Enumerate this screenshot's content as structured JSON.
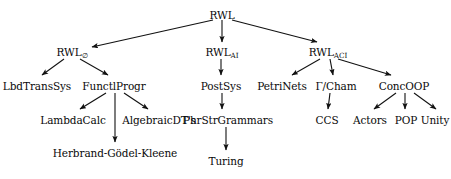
{
  "diagram": {
    "type": "tree",
    "background_color": "#ffffff",
    "text_color": "#0a0a0a",
    "edge_color": "#111111",
    "nodes": [
      {
        "id": "rwl",
        "label": "RWL",
        "sub": "",
        "x": 222,
        "y": 9,
        "level": 0
      },
      {
        "id": "rwl_empty",
        "label": "RWL",
        "sub": "∅",
        "x": 72,
        "y": 46,
        "level": 1
      },
      {
        "id": "rwl_ai",
        "label": "RWL",
        "sub": "AI",
        "x": 222,
        "y": 46,
        "level": 1
      },
      {
        "id": "rwl_aci",
        "label": "RWL",
        "sub": "ACI",
        "x": 328,
        "y": 46,
        "level": 1
      },
      {
        "id": "lbdtranssys",
        "label": "LbdTransSys",
        "sub": "",
        "x": 37,
        "y": 80,
        "level": 2
      },
      {
        "id": "functlprogr",
        "label": "FunctlProgr",
        "sub": "",
        "x": 114,
        "y": 80,
        "level": 2
      },
      {
        "id": "postsys",
        "label": "PostSys",
        "sub": "",
        "x": 221,
        "y": 80,
        "level": 2
      },
      {
        "id": "petrinets",
        "label": "PetriNets",
        "sub": "",
        "x": 282,
        "y": 80,
        "level": 2
      },
      {
        "id": "gammacham",
        "label": "Γ/Cham",
        "sub": "",
        "x": 336,
        "y": 80,
        "level": 2
      },
      {
        "id": "concoop",
        "label": "ConcOOP",
        "sub": "",
        "x": 404,
        "y": 80,
        "level": 2
      },
      {
        "id": "lambdacalc",
        "label": "LambdaCalc",
        "sub": "",
        "x": 73,
        "y": 114,
        "level": 3
      },
      {
        "id": "algebraicdts",
        "label": "AlgebraicDT's",
        "sub": "",
        "x": 159,
        "y": 114,
        "level": 3
      },
      {
        "id": "phrstrgrammars",
        "label": "PhrStrGrammars",
        "sub": "",
        "x": 228,
        "y": 114,
        "level": 3
      },
      {
        "id": "ccs",
        "label": "CCS",
        "sub": "",
        "x": 327,
        "y": 114,
        "level": 3
      },
      {
        "id": "actors",
        "label": "Actors",
        "sub": "",
        "x": 370,
        "y": 114,
        "level": 3
      },
      {
        "id": "pop",
        "label": "POP",
        "sub": "",
        "x": 406,
        "y": 114,
        "level": 3
      },
      {
        "id": "unity",
        "label": "Unity",
        "sub": "",
        "x": 435,
        "y": 114,
        "level": 3
      },
      {
        "id": "herbrand",
        "label": "Herbrand-Gödel-Kleene",
        "sub": "",
        "x": 115,
        "y": 147,
        "level": 4
      },
      {
        "id": "turing",
        "label": "Turing",
        "sub": "",
        "x": 226,
        "y": 155,
        "level": 4
      }
    ],
    "edges": [
      {
        "from": "rwl",
        "to": "rwl_empty",
        "x1": 213,
        "y1": 20,
        "x2": 92,
        "y2": 47
      },
      {
        "from": "rwl",
        "to": "rwl_ai",
        "x1": 222,
        "y1": 20,
        "x2": 222,
        "y2": 42
      },
      {
        "from": "rwl",
        "to": "rwl_aci",
        "x1": 232,
        "y1": 20,
        "x2": 317,
        "y2": 42
      },
      {
        "from": "rwl_empty",
        "to": "lbdtranssys",
        "x1": 64,
        "y1": 59,
        "x2": 42,
        "y2": 75
      },
      {
        "from": "rwl_empty",
        "to": "functlprogr",
        "x1": 80,
        "y1": 59,
        "x2": 108,
        "y2": 75
      },
      {
        "from": "rwl_ai",
        "to": "postsys",
        "x1": 221,
        "y1": 59,
        "x2": 221,
        "y2": 75
      },
      {
        "from": "rwl_aci",
        "to": "petrinets",
        "x1": 320,
        "y1": 59,
        "x2": 292,
        "y2": 75
      },
      {
        "from": "rwl_aci",
        "to": "gammacham",
        "x1": 330,
        "y1": 59,
        "x2": 333,
        "y2": 75
      },
      {
        "from": "rwl_aci",
        "to": "concoop",
        "x1": 338,
        "y1": 59,
        "x2": 391,
        "y2": 75
      },
      {
        "from": "functlprogr",
        "to": "lambdacalc",
        "x1": 106,
        "y1": 93,
        "x2": 80,
        "y2": 109
      },
      {
        "from": "functlprogr",
        "to": "herbrand",
        "x1": 115,
        "y1": 93,
        "x2": 115,
        "y2": 142
      },
      {
        "from": "functlprogr",
        "to": "algebraicdts",
        "x1": 124,
        "y1": 93,
        "x2": 148,
        "y2": 109
      },
      {
        "from": "postsys",
        "to": "phrstrgrammars",
        "x1": 222,
        "y1": 93,
        "x2": 222,
        "y2": 109
      },
      {
        "from": "gammacham",
        "to": "ccs",
        "x1": 330,
        "y1": 93,
        "x2": 328,
        "y2": 109
      },
      {
        "from": "concoop",
        "to": "actors",
        "x1": 396,
        "y1": 93,
        "x2": 374,
        "y2": 109
      },
      {
        "from": "concoop",
        "to": "pop",
        "x1": 405,
        "y1": 93,
        "x2": 405,
        "y2": 109
      },
      {
        "from": "concoop",
        "to": "unity",
        "x1": 414,
        "y1": 93,
        "x2": 436,
        "y2": 109
      },
      {
        "from": "phrstrgrammars",
        "to": "turing",
        "x1": 226,
        "y1": 127,
        "x2": 226,
        "y2": 150
      }
    ]
  }
}
